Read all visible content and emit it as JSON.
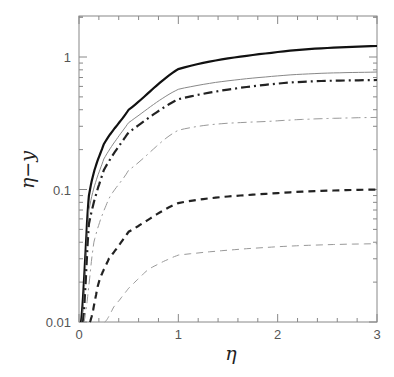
{
  "chart_data": {
    "type": "line",
    "title": "",
    "xlabel": "η",
    "ylabel": "η−y",
    "xlim": [
      0,
      3
    ],
    "ylim": [
      0.01,
      2
    ],
    "yscale": "log",
    "grid": false,
    "legend": null,
    "x_ticks": [
      0,
      1,
      2,
      3
    ],
    "x_tick_labels": [
      "0",
      "1",
      "2",
      "3"
    ],
    "y_ticks": [
      0.01,
      0.1,
      1
    ],
    "y_tick_labels": [
      "0.01",
      "0.1",
      "1"
    ],
    "series": [
      {
        "name": "thick-solid",
        "style": "solid",
        "width": 2.2,
        "color": "#111111",
        "x": [
          0.02,
          0.1,
          0.25,
          0.5,
          1,
          2,
          3
        ],
        "values": [
          0.01,
          0.09,
          0.22,
          0.4,
          0.81,
          1.09,
          1.21
        ]
      },
      {
        "name": "thin-solid",
        "style": "solid",
        "width": 1.0,
        "color": "#888888",
        "x": [
          0.03,
          0.1,
          0.25,
          0.5,
          1,
          2,
          3
        ],
        "values": [
          0.01,
          0.07,
          0.17,
          0.32,
          0.57,
          0.72,
          0.77
        ]
      },
      {
        "name": "thick-dashdot",
        "style": "dashdot",
        "width": 2.2,
        "color": "#222222",
        "x": [
          0.04,
          0.1,
          0.25,
          0.5,
          1,
          2,
          3
        ],
        "values": [
          0.01,
          0.055,
          0.14,
          0.27,
          0.48,
          0.63,
          0.67
        ]
      },
      {
        "name": "thin-dashdot",
        "style": "dashdot",
        "width": 1.0,
        "color": "#999999",
        "x": [
          0.05,
          0.15,
          0.3,
          0.5,
          1,
          2,
          3
        ],
        "values": [
          0.01,
          0.04,
          0.085,
          0.14,
          0.28,
          0.33,
          0.35
        ]
      },
      {
        "name": "thick-dashed",
        "style": "dashed",
        "width": 2.2,
        "color": "#222222",
        "x": [
          0.11,
          0.2,
          0.3,
          0.5,
          1,
          2,
          3
        ],
        "values": [
          0.01,
          0.02,
          0.03,
          0.048,
          0.079,
          0.094,
          0.1
        ]
      },
      {
        "name": "thin-dashed",
        "style": "dashed",
        "width": 1.0,
        "color": "#999999",
        "x": [
          0.26,
          0.35,
          0.5,
          0.7,
          1,
          2,
          3
        ],
        "values": [
          0.01,
          0.013,
          0.018,
          0.025,
          0.032,
          0.037,
          0.039
        ]
      }
    ]
  },
  "layout": {
    "plot_left": 79,
    "plot_right": 377,
    "plot_top": 16,
    "plot_bottom": 322
  }
}
